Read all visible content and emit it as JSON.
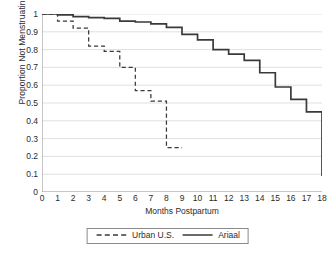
{
  "chart_data": {
    "type": "line",
    "title": "",
    "xlabel": "Months Postpartum",
    "ylabel": "Proportion Not Menstruating",
    "xlim": [
      0,
      18
    ],
    "ylim": [
      0,
      1
    ],
    "xticks": [
      0,
      1,
      2,
      3,
      4,
      5,
      6,
      7,
      8,
      9,
      10,
      11,
      12,
      13,
      14,
      15,
      16,
      17,
      18
    ],
    "yticks": [
      "0",
      "0.1",
      "0.2",
      "0.3",
      "0.4",
      "0.5",
      "0.6",
      "0.7",
      "0.8",
      "0.9",
      "1"
    ],
    "grid": "horizontal",
    "legend_position": "bottom-center",
    "step_style": "post",
    "series": [
      {
        "name": "Urban U.S.",
        "style": "dashed",
        "color": "#3a3a3a",
        "x": [
          0,
          1,
          2,
          3,
          4,
          5,
          6,
          7,
          8,
          9
        ],
        "values": [
          1.0,
          0.96,
          0.92,
          0.82,
          0.79,
          0.7,
          0.57,
          0.51,
          0.25,
          0.25
        ]
      },
      {
        "name": "Ariaal",
        "style": "solid",
        "color": "#3a3a3a",
        "x": [
          0,
          1,
          2,
          3,
          4,
          5,
          6,
          7,
          8,
          9,
          10,
          11,
          12,
          13,
          14,
          15,
          16,
          17,
          18
        ],
        "values": [
          1.0,
          0.995,
          0.985,
          0.98,
          0.975,
          0.96,
          0.955,
          0.945,
          0.925,
          0.885,
          0.855,
          0.8,
          0.775,
          0.74,
          0.67,
          0.59,
          0.52,
          0.45,
          0.09
        ]
      }
    ]
  },
  "axis": {
    "y_title": "Proportion Not Menstruating",
    "x_title": "Months Postpartum"
  },
  "legend": {
    "items": [
      {
        "label": "Urban U.S."
      },
      {
        "label": "Ariaal"
      }
    ]
  }
}
